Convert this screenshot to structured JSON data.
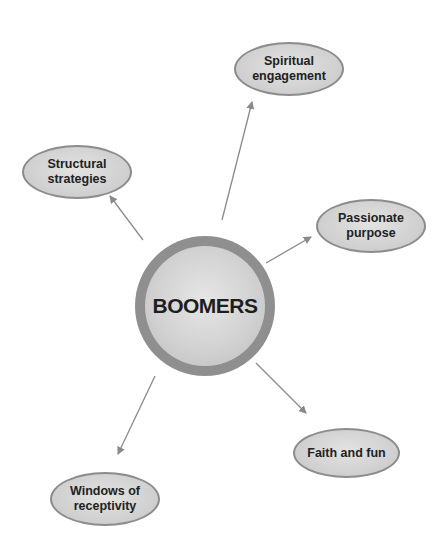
{
  "diagram": {
    "type": "hub-and-spoke",
    "center": {
      "label": "BOOMERS"
    },
    "nodes": [
      {
        "id": "spiritual",
        "label": "Spiritual\nengagement"
      },
      {
        "id": "structural",
        "label": "Structural\nstrategies"
      },
      {
        "id": "passionate",
        "label": "Passionate\npurpose"
      },
      {
        "id": "faith",
        "label": "Faith and fun"
      },
      {
        "id": "windows",
        "label": "Windows of\nreceptivity"
      }
    ],
    "edges": [
      {
        "from": "BOOMERS",
        "to": "Spiritual engagement"
      },
      {
        "from": "BOOMERS",
        "to": "Structural strategies"
      },
      {
        "from": "BOOMERS",
        "to": "Passionate purpose"
      },
      {
        "from": "BOOMERS",
        "to": "Faith and fun"
      },
      {
        "from": "BOOMERS",
        "to": "Windows of receptivity"
      }
    ],
    "colors": {
      "node_fill": "#d0d0d0",
      "node_border": "#8c8c8c",
      "ring": "#8f8f8f",
      "arrow": "#8a8a8a"
    }
  }
}
